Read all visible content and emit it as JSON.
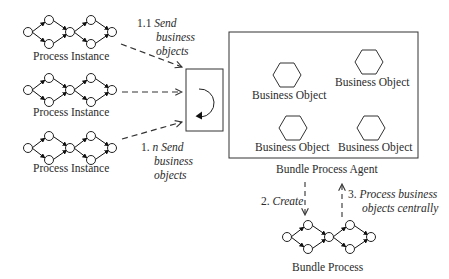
{
  "diagram": {
    "process_instances": [
      {
        "label": "Process Instance"
      },
      {
        "label": "Process Instance"
      },
      {
        "label": "Process Instance"
      }
    ],
    "agent": {
      "label": "Bundle Process Agent",
      "loop_icon": "cycle-arrow-icon",
      "business_objects": [
        {
          "label": "Business Object"
        },
        {
          "label": "Business Object"
        },
        {
          "label": "Business Object"
        },
        {
          "label": "Business Object"
        }
      ]
    },
    "bundle_process": {
      "label": "Bundle Process"
    },
    "steps": {
      "s1_1": {
        "num": "1.1",
        "text_line1": "Send",
        "text_line2": "business",
        "text_line3": "objects"
      },
      "s1_n": {
        "num": "1.",
        "n": "n",
        "text_line1": "Send",
        "text_line2": "business",
        "text_line3": "objects"
      },
      "s2": {
        "num": "2.",
        "text": "Create"
      },
      "s3": {
        "num": "3.",
        "text_line1": "Process business",
        "text_line2": "objects centrally"
      }
    }
  }
}
